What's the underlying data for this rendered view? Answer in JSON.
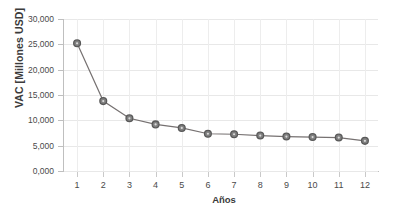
{
  "chart_data": {
    "type": "line",
    "title": "",
    "xlabel": "Años",
    "ylabel": "VAC [Millones USD]",
    "categories": [
      "1",
      "2",
      "3",
      "4",
      "5",
      "6",
      "7",
      "8",
      "9",
      "10",
      "11",
      "12"
    ],
    "x": [
      1,
      2,
      3,
      4,
      5,
      6,
      7,
      8,
      9,
      10,
      11,
      12
    ],
    "values": [
      25200,
      13800,
      10400,
      9200,
      8500,
      7350,
      7250,
      7000,
      6800,
      6700,
      6600,
      5950
    ],
    "series": [
      {
        "name": "VAC",
        "values": [
          25200,
          13800,
          10400,
          9200,
          8500,
          7350,
          7250,
          7000,
          6800,
          6700,
          6600,
          5950
        ]
      }
    ],
    "ylim": [
      0,
      30000
    ],
    "xlim": [
      0.5,
      12.5
    ],
    "ytick_labels": [
      "0,000",
      "5,000",
      "10,000",
      "15,000",
      "20,000",
      "25,000",
      "30,000"
    ],
    "ytick_values": [
      0,
      5000,
      10000,
      15000,
      20000,
      25000,
      30000
    ],
    "xtick_labels": [
      "1",
      "2",
      "3",
      "4",
      "5",
      "6",
      "7",
      "8",
      "9",
      "10",
      "11",
      "12"
    ],
    "grid": true,
    "grid_axis": "both",
    "legend": false,
    "legend_position": "none",
    "line_color": "#767171",
    "marker_color": "#808080",
    "marker_edge_color": "#595959",
    "marker_shape": "circle",
    "grid_color": "#e8e8e8",
    "background_color": "#ffffff",
    "axis_color": "#bfbfbf",
    "text_color": "#404040"
  }
}
